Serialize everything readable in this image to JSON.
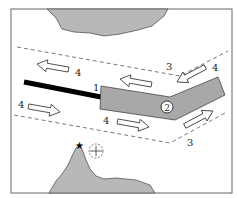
{
  "diagram": {
    "type": "coastal map schematic",
    "colors": {
      "land": "#b8b8b8",
      "pier": "#a8a8a8",
      "pier_outline": "#444444",
      "breakwater": "#000000",
      "dashed_line": "#555555",
      "frame": "#666666"
    },
    "labels": {
      "breakwater": "1",
      "pier_number": "2",
      "line_top_right": "3",
      "line_bottom_right": "3",
      "arrow_top_left": "4",
      "arrow_top_right": "4",
      "arrow_bottom_left": "4",
      "arrow_bottom_mid": "4"
    },
    "symbols": {
      "summit_marker": "★",
      "location_marker": "+"
    }
  }
}
